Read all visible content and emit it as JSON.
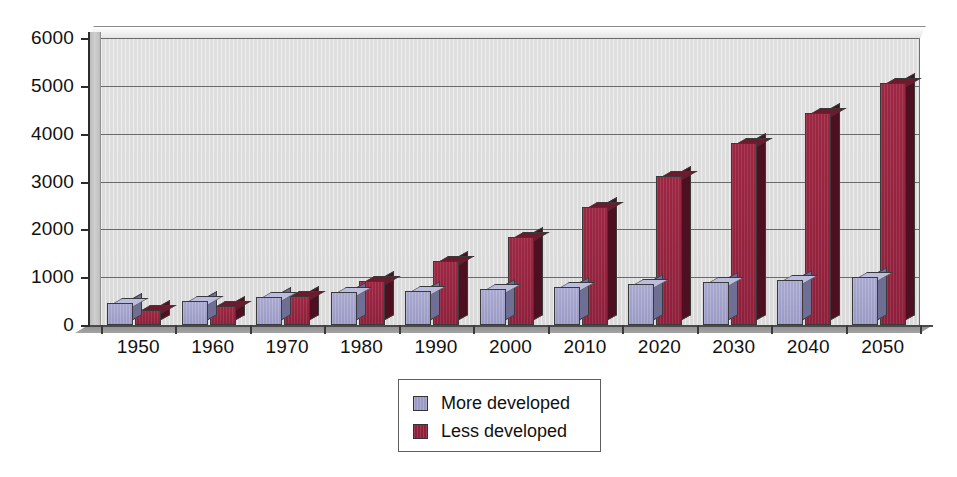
{
  "chart_data": {
    "type": "bar",
    "title": "",
    "subtitle": "",
    "xlabel": "",
    "ylabel": "",
    "ylim": [
      0,
      6000
    ],
    "ytick_step": 1000,
    "yticks": [
      "6000",
      "5000",
      "4000",
      "3000",
      "2000",
      "1000",
      "0"
    ],
    "grid": true,
    "grid_axis": "y",
    "legend_position": "bottom-center",
    "style": "3d-clustered-column",
    "categories": [
      "1950",
      "1960",
      "1970",
      "1980",
      "1990",
      "2000",
      "2010",
      "2020",
      "2030",
      "2040",
      "2050"
    ],
    "series": [
      {
        "name": "More developed",
        "color": "#9A9AC6",
        "values": [
          460,
          500,
          580,
          680,
          720,
          760,
          800,
          850,
          900,
          950,
          1000
        ]
      },
      {
        "name": "Less developed",
        "color": "#8E203B",
        "values": [
          310,
          400,
          610,
          930,
          1330,
          1840,
          2460,
          3120,
          3800,
          4440,
          5050
        ]
      }
    ]
  },
  "legend": {
    "items": [
      {
        "label": "More developed",
        "swatch": "more"
      },
      {
        "label": "Less developed",
        "swatch": "less"
      }
    ]
  },
  "background_text": {
    "content": "                                                                                                                                                                                                                                                                                                                                    "
  }
}
